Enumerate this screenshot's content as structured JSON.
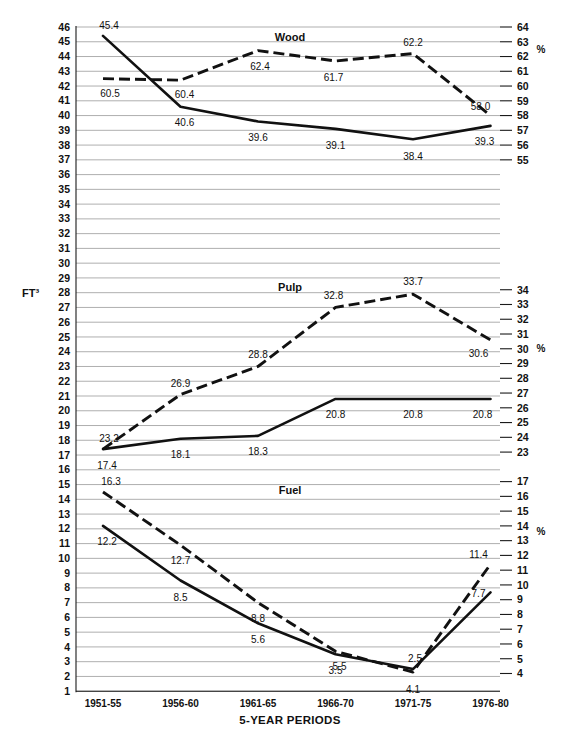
{
  "axes": {
    "left_title": "FT³",
    "right_symbol": "%",
    "x_caption": "5-YEAR PERIODS",
    "left_ticks": [
      46,
      45,
      44,
      43,
      42,
      41,
      40,
      39,
      38,
      37,
      36,
      35,
      34,
      33,
      32,
      31,
      30,
      29,
      28,
      27,
      26,
      25,
      24,
      23,
      22,
      21,
      20,
      19,
      18,
      17,
      16,
      15,
      14,
      13,
      12,
      11,
      10,
      9,
      8,
      7,
      6,
      5,
      4,
      3,
      2,
      1
    ],
    "left_range": [
      1,
      46
    ]
  },
  "categories": [
    "1951-55",
    "1956-60",
    "1961-65",
    "1966-70",
    "1971-75",
    "1976-80"
  ],
  "panels": [
    {
      "title": "Wood",
      "right_ticks": [
        64,
        63,
        62,
        61,
        60,
        59,
        58,
        57,
        56,
        55
      ],
      "right_range": [
        55,
        64
      ],
      "cuft": {
        "values": [
          45.4,
          40.6,
          39.6,
          39.1,
          38.4,
          39.3
        ],
        "label_offsets": [
          {
            "dx": 6,
            "dy": -7
          },
          {
            "dx": 4,
            "dy": 19
          },
          {
            "dx": 0,
            "dy": 20
          },
          {
            "dx": 0,
            "dy": 20
          },
          {
            "dx": 0,
            "dy": 21
          },
          {
            "dx": -6,
            "dy": 19
          }
        ]
      },
      "pct": {
        "values": [
          60.5,
          60.4,
          62.4,
          61.7,
          62.2,
          58.0
        ],
        "label_offsets": [
          {
            "dx": 7,
            "dy": 18
          },
          {
            "dx": 4,
            "dy": 18
          },
          {
            "dx": 2,
            "dy": 19
          },
          {
            "dx": -2,
            "dy": 20
          },
          {
            "dx": 0,
            "dy": -8
          },
          {
            "dx": -10,
            "dy": -6
          }
        ]
      }
    },
    {
      "title": "Pulp",
      "right_ticks": [
        34,
        33,
        32,
        31,
        30,
        29,
        28,
        27,
        26,
        25,
        24,
        23
      ],
      "right_range": [
        23,
        34
      ],
      "cuft": {
        "values": [
          17.4,
          18.1,
          18.3,
          20.8,
          20.8,
          20.8
        ],
        "label_offsets": [
          {
            "dx": 4,
            "dy": 20
          },
          {
            "dx": 0,
            "dy": 19
          },
          {
            "dx": 0,
            "dy": 19
          },
          {
            "dx": 0,
            "dy": 19
          },
          {
            "dx": 0,
            "dy": 19
          },
          {
            "dx": -8,
            "dy": 19
          }
        ]
      },
      "pct": {
        "values": [
          23.2,
          26.9,
          28.8,
          32.8,
          33.7,
          30.6
        ],
        "label_offsets": [
          {
            "dx": 6,
            "dy": -7
          },
          {
            "dx": 0,
            "dy": -8
          },
          {
            "dx": 0,
            "dy": -8
          },
          {
            "dx": -2,
            "dy": -8
          },
          {
            "dx": 0,
            "dy": -9
          },
          {
            "dx": -12,
            "dy": 17
          }
        ]
      }
    },
    {
      "title": "Fuel",
      "right_ticks": [
        17,
        16,
        15,
        14,
        13,
        12,
        11,
        10,
        9,
        8,
        7,
        6,
        5,
        4
      ],
      "right_range": [
        4,
        17
      ],
      "cuft": {
        "values": [
          12.2,
          8.5,
          5.6,
          3.5,
          2.5,
          7.7
        ],
        "label_offsets": [
          {
            "dx": 4,
            "dy": 19
          },
          {
            "dx": 0,
            "dy": 20
          },
          {
            "dx": 0,
            "dy": 20
          },
          {
            "dx": 0,
            "dy": 20
          },
          {
            "dx": 2,
            "dy": -7
          },
          {
            "dx": -12,
            "dy": 5
          }
        ]
      },
      "pct": {
        "values": [
          16.3,
          12.7,
          8.8,
          5.5,
          4.1,
          11.4
        ],
        "label_offsets": [
          {
            "dx": 8,
            "dy": -7
          },
          {
            "dx": 0,
            "dy": 19
          },
          {
            "dx": 0,
            "dy": 19
          },
          {
            "dx": 4,
            "dy": 19
          },
          {
            "dx": 0,
            "dy": 21
          },
          {
            "dx": -12,
            "dy": -6
          }
        ]
      }
    }
  ],
  "chart_data": {
    "type": "line",
    "title": "",
    "xlabel": "5-YEAR PERIODS",
    "ylabel": "FT³",
    "y2label": "%",
    "grid": true,
    "legend": "none",
    "categories": [
      "1951-55",
      "1956-60",
      "1961-65",
      "1966-70",
      "1971-75",
      "1976-80"
    ],
    "panels": [
      {
        "name": "Wood",
        "ylim": [
          1,
          46
        ],
        "y2lim": [
          55,
          64
        ],
        "series": [
          {
            "name": "Wood FT³",
            "axis": "left",
            "style": "solid",
            "values": [
              45.4,
              40.6,
              39.6,
              39.1,
              38.4,
              39.3
            ]
          },
          {
            "name": "Wood %",
            "axis": "right",
            "style": "dashed",
            "values": [
              60.5,
              60.4,
              62.4,
              61.7,
              62.2,
              58.0
            ]
          }
        ]
      },
      {
        "name": "Pulp",
        "ylim": [
          1,
          46
        ],
        "y2lim": [
          23,
          34
        ],
        "series": [
          {
            "name": "Pulp FT³",
            "axis": "left",
            "style": "solid",
            "values": [
              17.4,
              18.1,
              18.3,
              20.8,
              20.8,
              20.8
            ]
          },
          {
            "name": "Pulp %",
            "axis": "right",
            "style": "dashed",
            "values": [
              23.2,
              26.9,
              28.8,
              32.8,
              33.7,
              30.6
            ]
          }
        ]
      },
      {
        "name": "Fuel",
        "ylim": [
          1,
          46
        ],
        "y2lim": [
          4,
          17
        ],
        "series": [
          {
            "name": "Fuel FT³",
            "axis": "left",
            "style": "solid",
            "values": [
              12.2,
              8.5,
              5.6,
              3.5,
              2.5,
              7.7
            ]
          },
          {
            "name": "Fuel %",
            "axis": "right",
            "style": "dashed",
            "values": [
              16.3,
              12.7,
              8.8,
              5.5,
              4.1,
              11.4
            ]
          }
        ]
      }
    ]
  }
}
